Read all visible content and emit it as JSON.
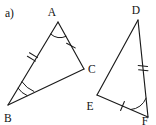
{
  "figure": {
    "part_label": "a)",
    "background_color": "#ffffff",
    "stroke_color": "#1a1a1a",
    "triangles": [
      {
        "name": "triangle-abc",
        "vertices": [
          {
            "label": "A",
            "x": 58,
            "y": 22,
            "label_x": 52,
            "label_y": 16
          },
          {
            "label": "B",
            "x": 8,
            "y": 105,
            "label_x": 4,
            "label_y": 122
          },
          {
            "label": "C",
            "x": 84,
            "y": 69,
            "label_x": 88,
            "label_y": 73
          }
        ],
        "sides": [
          {
            "name": "side-ab",
            "from": "A",
            "to": "B",
            "tick_count": 2
          },
          {
            "name": "side-ac",
            "from": "A",
            "to": "C",
            "tick_count": 1
          },
          {
            "name": "side-bc",
            "from": "B",
            "to": "C",
            "tick_count": 0
          }
        ],
        "angles": [
          {
            "name": "angle-a",
            "vertex": "A",
            "arc_count": 1
          },
          {
            "name": "angle-b",
            "vertex": "B",
            "arc_count": 2
          },
          {
            "name": "angle-c",
            "vertex": "C",
            "arc_count": 0
          }
        ]
      },
      {
        "name": "triangle-def",
        "vertices": [
          {
            "label": "D",
            "x": 138,
            "y": 20,
            "label_x": 136,
            "label_y": 14
          },
          {
            "label": "E",
            "x": 97,
            "y": 95,
            "label_x": 90,
            "label_y": 110
          },
          {
            "label": "F",
            "x": 148,
            "y": 117,
            "label_x": 144,
            "label_y": 125
          }
        ],
        "sides": [
          {
            "name": "side-de",
            "from": "D",
            "to": "E",
            "tick_count": 0
          },
          {
            "name": "side-df",
            "from": "D",
            "to": "F",
            "tick_count": 2
          },
          {
            "name": "side-ef",
            "from": "E",
            "to": "F",
            "tick_count": 1
          }
        ],
        "angles": [
          {
            "name": "angle-d",
            "vertex": "D",
            "arc_count": 0
          },
          {
            "name": "angle-e",
            "vertex": "E",
            "arc_count": 0
          },
          {
            "name": "angle-f",
            "vertex": "F",
            "arc_count": 1
          }
        ]
      }
    ]
  }
}
